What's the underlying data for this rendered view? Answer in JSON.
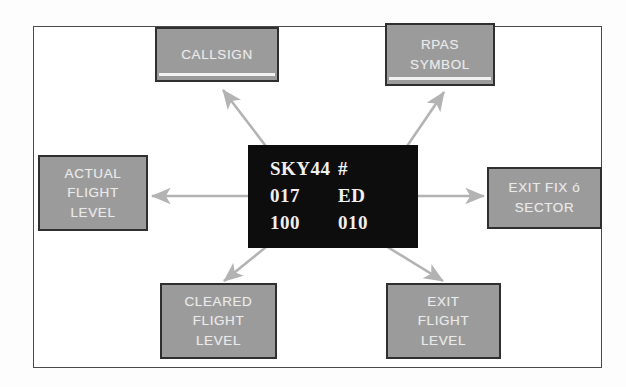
{
  "diagram": {
    "colors": {
      "callout_fill": "#9b9b9b",
      "callout_border": "#2f2f2f",
      "callout_text": "#e9e9e9",
      "label_background": "#0d0d0d",
      "label_text": "#f0f0f0",
      "arrow": "#b3b3b3",
      "frame_border": "#4a4a4a"
    },
    "callouts": [
      {
        "id": "callsign",
        "lines": [
          "CALLSIGN"
        ]
      },
      {
        "id": "rpas",
        "lines": [
          "RPAS",
          "SYMBOL"
        ]
      },
      {
        "id": "actual_fl",
        "lines": [
          "ACTUAL",
          "FLIGHT",
          "LEVEL"
        ]
      },
      {
        "id": "exit_fix",
        "lines": [
          "EXIT FIX ó",
          "SECTOR"
        ]
      },
      {
        "id": "cleared_fl",
        "lines": [
          "CLEARED",
          "FLIGHT",
          "LEVEL"
        ]
      },
      {
        "id": "exit_fl",
        "lines": [
          "EXIT",
          "FLIGHT",
          "LEVEL"
        ]
      }
    ],
    "radar_label": {
      "rows": [
        {
          "left": "SKY44",
          "right": "#"
        },
        {
          "left": "017",
          "right": "ED"
        },
        {
          "left": "100",
          "right": "010"
        }
      ]
    },
    "arrows": [
      {
        "from": "radar-label",
        "to": "callsign",
        "direction": "up-left"
      },
      {
        "from": "radar-label",
        "to": "rpas",
        "direction": "up-right"
      },
      {
        "from": "radar-label",
        "to": "actual_fl",
        "direction": "left"
      },
      {
        "from": "radar-label",
        "to": "exit_fix",
        "direction": "right"
      },
      {
        "from": "radar-label",
        "to": "cleared_fl",
        "direction": "down-left"
      },
      {
        "from": "radar-label",
        "to": "exit_fl",
        "direction": "down-right"
      }
    ]
  }
}
